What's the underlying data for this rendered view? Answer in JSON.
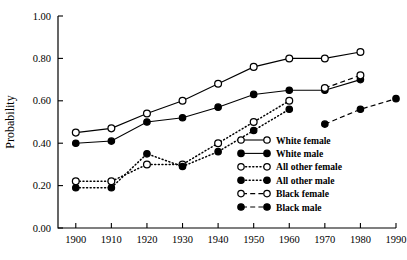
{
  "chart_data": {
    "type": "line",
    "title": "",
    "xlabel": "",
    "ylabel": "Probability",
    "xlim": [
      1895,
      1990
    ],
    "ylim": [
      0.0,
      1.0
    ],
    "grid": false,
    "legend_position": "bottom-right",
    "x_ticks": [
      "1900",
      "1910",
      "1920",
      "1930",
      "1940",
      "1950",
      "1960",
      "1970",
      "1980",
      "1990"
    ],
    "y_ticks": [
      "0.00",
      "0.20",
      "0.40",
      "0.60",
      "0.80",
      "1.00"
    ],
    "x": [
      1900,
      1910,
      1920,
      1930,
      1940,
      1950,
      1960,
      1970,
      1980,
      1990
    ],
    "series": [
      {
        "name": "White female",
        "marker": "open-circle",
        "linestyle": "solid",
        "x": [
          1900,
          1910,
          1920,
          1930,
          1940,
          1950,
          1960,
          1970,
          1980
        ],
        "values": [
          0.45,
          0.47,
          0.54,
          0.6,
          0.68,
          0.76,
          0.8,
          0.8,
          0.83
        ]
      },
      {
        "name": "White male",
        "marker": "closed-circle",
        "linestyle": "solid",
        "x": [
          1900,
          1910,
          1920,
          1930,
          1940,
          1950,
          1960,
          1970,
          1980
        ],
        "values": [
          0.4,
          0.41,
          0.5,
          0.52,
          0.57,
          0.63,
          0.65,
          0.65,
          0.7
        ]
      },
      {
        "name": "All other female",
        "marker": "open-circle",
        "linestyle": "dotted",
        "x": [
          1900,
          1910,
          1920,
          1930,
          1940,
          1950,
          1960
        ],
        "values": [
          0.22,
          0.22,
          0.3,
          0.3,
          0.4,
          0.5,
          0.6
        ]
      },
      {
        "name": "All other male",
        "marker": "closed-circle",
        "linestyle": "dotted",
        "x": [
          1900,
          1910,
          1920,
          1930,
          1940,
          1950,
          1960
        ],
        "values": [
          0.19,
          0.19,
          0.35,
          0.29,
          0.36,
          0.46,
          0.56
        ]
      },
      {
        "name": "Black female",
        "marker": "open-circle",
        "linestyle": "dashed",
        "x": [
          1970,
          1980
        ],
        "values": [
          0.66,
          0.72
        ]
      },
      {
        "name": "Black male",
        "marker": "closed-circle",
        "linestyle": "dashed",
        "x": [
          1970,
          1980,
          1990
        ],
        "values": [
          0.49,
          0.56,
          0.61
        ]
      }
    ],
    "legend": [
      {
        "label": "White female",
        "marker": "open-circle",
        "linestyle": "solid"
      },
      {
        "label": "White male",
        "marker": "closed-circle",
        "linestyle": "solid"
      },
      {
        "label": "All other female",
        "marker": "open-circle",
        "linestyle": "dotted"
      },
      {
        "label": "All other male",
        "marker": "closed-circle",
        "linestyle": "dotted"
      },
      {
        "label": "Black female",
        "marker": "open-circle",
        "linestyle": "dashed"
      },
      {
        "label": "Black male",
        "marker": "closed-circle",
        "linestyle": "dashed"
      }
    ],
    "colors": {
      "ink": "#000000",
      "background": "#ffffff"
    }
  }
}
